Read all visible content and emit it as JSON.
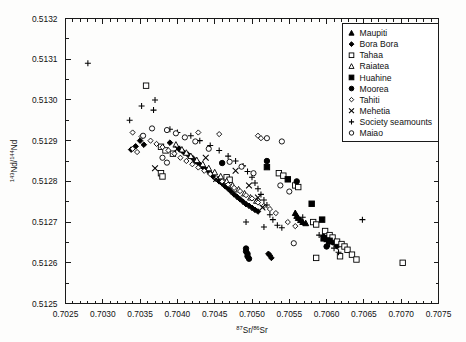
{
  "figure": {
    "background": "#fdfdfc",
    "axis_color": "#1a1a1a",
    "marker_color": "#000000"
  },
  "chart_data": {
    "type": "scatter",
    "title": "",
    "xlabel": "87Sr/86Sr",
    "xlabel_parts": {
      "sup1": "87",
      "base1": "Sr/",
      "sup2": "86",
      "base2": "Sr"
    },
    "ylabel": "143Nd/144Nd",
    "ylabel_parts": {
      "sup1": "143",
      "base1": "Nd/",
      "sup2": "144",
      "base2": "Nd"
    },
    "xlim": [
      0.7025,
      0.7075
    ],
    "ylim": [
      0.5125,
      0.5132
    ],
    "xticks": [
      0.7025,
      0.703,
      0.7035,
      0.704,
      0.7045,
      0.705,
      0.7055,
      0.706,
      0.7065,
      0.707,
      0.7075
    ],
    "xticklabels": [
      "0.7025",
      "0.7030",
      "0.7035",
      "0.7040",
      "0.7045",
      "0.7050",
      "0.7055",
      "0.7060",
      "0.7065",
      "0.7070",
      "0.7075"
    ],
    "yticks": [
      0.5125,
      0.5126,
      0.5127,
      0.5128,
      0.5129,
      0.513,
      0.5131,
      0.5132
    ],
    "yticklabels": [
      "0.5125",
      "0.5126",
      "0.5127",
      "0.5128",
      "0.5129",
      "0.5130",
      "0.5131",
      "0.5132"
    ],
    "x_minor_interval": 0.0001,
    "y_minor_interval": 5e-05,
    "grid": false,
    "legend_position": "top-right",
    "series": [
      {
        "name": "Maupiti",
        "marker": "filled-triangle",
        "points": [
          [
            0.70562,
            0.51271
          ],
          [
            0.70565,
            0.512705
          ],
          [
            0.70568,
            0.5127
          ],
          [
            0.70572,
            0.512697
          ],
          [
            0.7056,
            0.512715
          ],
          [
            0.70558,
            0.512722
          ]
        ]
      },
      {
        "name": "Bora Bora",
        "marker": "filled-diamond",
        "points": [
          [
            0.7039,
            0.512895
          ],
          [
            0.70402,
            0.51288
          ],
          [
            0.70408,
            0.512872
          ],
          [
            0.70414,
            0.512866
          ],
          [
            0.7042,
            0.512858
          ],
          [
            0.70424,
            0.51285
          ],
          [
            0.70428,
            0.512845
          ],
          [
            0.70432,
            0.512838
          ],
          [
            0.70436,
            0.512832
          ],
          [
            0.7044,
            0.512828
          ],
          [
            0.70444,
            0.51282
          ],
          [
            0.70448,
            0.512812
          ],
          [
            0.70452,
            0.512806
          ],
          [
            0.70456,
            0.5128
          ],
          [
            0.7046,
            0.512795
          ],
          [
            0.70464,
            0.512788
          ],
          [
            0.70468,
            0.512782
          ],
          [
            0.70472,
            0.512775
          ],
          [
            0.70476,
            0.512768
          ],
          [
            0.7048,
            0.512762
          ],
          [
            0.70484,
            0.512756
          ],
          [
            0.70488,
            0.51275
          ],
          [
            0.70492,
            0.512744
          ],
          [
            0.70496,
            0.51274
          ],
          [
            0.705,
            0.512735
          ],
          [
            0.70504,
            0.51273
          ],
          [
            0.70508,
            0.512726
          ],
          [
            0.70596,
            0.512665
          ],
          [
            0.706,
            0.51266
          ],
          [
            0.70604,
            0.512655
          ],
          [
            0.70608,
            0.51265
          ],
          [
            0.70612,
            0.512646
          ],
          [
            0.70614,
            0.51264
          ],
          [
            0.7035,
            0.5129
          ],
          [
            0.70355,
            0.51289
          ],
          [
            0.70344,
            0.512886
          ],
          [
            0.70338,
            0.512878
          ],
          [
            0.70522,
            0.512622
          ],
          [
            0.70524,
            0.512618
          ],
          [
            0.70526,
            0.512612
          ]
        ]
      },
      {
        "name": "Tahaa",
        "marker": "open-square",
        "points": [
          [
            0.70358,
            0.513035
          ],
          [
            0.70378,
            0.512885
          ],
          [
            0.70384,
            0.512876
          ],
          [
            0.70394,
            0.512868
          ],
          [
            0.70466,
            0.51281
          ],
          [
            0.7047,
            0.512804
          ],
          [
            0.70536,
            0.51282
          ],
          [
            0.70542,
            0.512814
          ],
          [
            0.70558,
            0.51279
          ],
          [
            0.70562,
            0.512786
          ],
          [
            0.70582,
            0.5127
          ],
          [
            0.70586,
            0.512694
          ],
          [
            0.70598,
            0.512678
          ],
          [
            0.70604,
            0.512668
          ],
          [
            0.70608,
            0.512662
          ],
          [
            0.70614,
            0.512652
          ],
          [
            0.7062,
            0.512646
          ],
          [
            0.70624,
            0.51264
          ],
          [
            0.70628,
            0.512632
          ],
          [
            0.70634,
            0.51262
          ],
          [
            0.7064,
            0.512608
          ],
          [
            0.70702,
            0.5126
          ],
          [
            0.70378,
            0.51282
          ],
          [
            0.7038,
            0.512812
          ],
          [
            0.70618,
            0.512616
          ],
          [
            0.70586,
            0.512612
          ]
        ]
      },
      {
        "name": "Raiatea",
        "marker": "open-triangle",
        "points": [
          [
            0.70398,
            0.51289
          ],
          [
            0.70406,
            0.512878
          ],
          [
            0.70412,
            0.51287
          ],
          [
            0.70418,
            0.512862
          ],
          [
            0.70426,
            0.512852
          ],
          [
            0.70434,
            0.512842
          ],
          [
            0.70442,
            0.512832
          ],
          [
            0.7045,
            0.512822
          ],
          [
            0.70458,
            0.512812
          ],
          [
            0.70466,
            0.5128
          ],
          [
            0.70474,
            0.51279
          ],
          [
            0.70482,
            0.51278
          ],
          [
            0.7049,
            0.51277
          ],
          [
            0.70498,
            0.51276
          ],
          [
            0.70506,
            0.512752
          ]
        ]
      },
      {
        "name": "Huahine",
        "marker": "filled-square",
        "points": [
          [
            0.70548,
            0.512805
          ],
          [
            0.7058,
            0.512745
          ],
          [
            0.70594,
            0.512706
          ],
          [
            0.70596,
            0.51266
          ],
          [
            0.70604,
            0.512654
          ],
          [
            0.7052,
            0.512835
          ]
        ]
      },
      {
        "name": "Moorea",
        "marker": "filled-circle",
        "points": [
          [
            0.70492,
            0.512635
          ],
          [
            0.70492,
            0.512628
          ],
          [
            0.70494,
            0.512622
          ],
          [
            0.70494,
            0.512616
          ],
          [
            0.70496,
            0.51261
          ],
          [
            0.7056,
            0.5128
          ],
          [
            0.7052,
            0.51285
          ],
          [
            0.706,
            0.51264
          ],
          [
            0.7046,
            0.512845
          ]
        ]
      },
      {
        "name": "Tahiti",
        "marker": "open-small-diamond",
        "points": [
          [
            0.7034,
            0.51292
          ],
          [
            0.70352,
            0.51291
          ],
          [
            0.70364,
            0.5129
          ],
          [
            0.70372,
            0.512892
          ],
          [
            0.7038,
            0.512884
          ],
          [
            0.70388,
            0.512876
          ],
          [
            0.70396,
            0.512868
          ],
          [
            0.70404,
            0.512858
          ],
          [
            0.70412,
            0.51285
          ],
          [
            0.7042,
            0.512842
          ],
          [
            0.70428,
            0.512834
          ],
          [
            0.70436,
            0.512826
          ],
          [
            0.70444,
            0.512818
          ],
          [
            0.70452,
            0.512808
          ],
          [
            0.7046,
            0.5128
          ],
          [
            0.70468,
            0.512792
          ],
          [
            0.70476,
            0.512784
          ],
          [
            0.70484,
            0.512776
          ],
          [
            0.70492,
            0.512766
          ],
          [
            0.705,
            0.512758
          ],
          [
            0.70508,
            0.512748
          ],
          [
            0.70516,
            0.51274
          ],
          [
            0.70524,
            0.512732
          ],
          [
            0.70532,
            0.512722
          ],
          [
            0.70548,
            0.5127
          ],
          [
            0.70558,
            0.51269
          ],
          [
            0.70428,
            0.51292
          ],
          [
            0.70456,
            0.512916
          ],
          [
            0.70508,
            0.512912
          ],
          [
            0.70512,
            0.512906
          ],
          [
            0.7034,
            0.51288
          ],
          [
            0.70346,
            0.512872
          ]
        ]
      },
      {
        "name": "Mehetia",
        "marker": "x-cross",
        "points": [
          [
            0.704,
            0.51288
          ],
          [
            0.70438,
            0.512858
          ],
          [
            0.70478,
            0.512826
          ],
          [
            0.70496,
            0.51279
          ],
          [
            0.70508,
            0.51276
          ],
          [
            0.70514,
            0.512736
          ],
          [
            0.7037,
            0.512832
          ],
          [
            0.70452,
            0.512806
          ]
        ]
      },
      {
        "name": "Society seamounts",
        "marker": "plus-cross",
        "points": [
          [
            0.7028,
            0.51309
          ],
          [
            0.70352,
            0.512985
          ],
          [
            0.70368,
            0.512975
          ],
          [
            0.7037,
            0.513
          ],
          [
            0.7039,
            0.512928
          ],
          [
            0.704,
            0.51292
          ],
          [
            0.70418,
            0.512912
          ],
          [
            0.7043,
            0.5129
          ],
          [
            0.70444,
            0.512888
          ],
          [
            0.70456,
            0.512876
          ],
          [
            0.70468,
            0.512862
          ],
          [
            0.70478,
            0.51285
          ],
          [
            0.70488,
            0.512838
          ],
          [
            0.70494,
            0.512824
          ],
          [
            0.705,
            0.51281
          ],
          [
            0.70504,
            0.512796
          ],
          [
            0.70508,
            0.512782
          ],
          [
            0.70512,
            0.512768
          ],
          [
            0.70516,
            0.512754
          ],
          [
            0.7052,
            0.512742
          ],
          [
            0.70524,
            0.512718
          ],
          [
            0.70528,
            0.512706
          ],
          [
            0.70534,
            0.512692
          ],
          [
            0.7054,
            0.512686
          ],
          [
            0.70568,
            0.512712
          ],
          [
            0.7059,
            0.512668
          ],
          [
            0.70596,
            0.512664
          ],
          [
            0.706,
            0.512652
          ],
          [
            0.70604,
            0.512646
          ],
          [
            0.7061,
            0.512636
          ],
          [
            0.70616,
            0.512626
          ],
          [
            0.70648,
            0.512706
          ],
          [
            0.70336,
            0.51295
          ],
          [
            0.70492,
            0.5127
          ],
          [
            0.70516,
            0.512688
          ]
        ]
      },
      {
        "name": "Maiao",
        "marker": "open-circle",
        "points": [
          [
            0.70366,
            0.51293
          ],
          [
            0.70386,
            0.512926
          ],
          [
            0.70398,
            0.512918
          ],
          [
            0.7041,
            0.512908
          ],
          [
            0.70424,
            0.512898
          ],
          [
            0.70442,
            0.51288
          ],
          [
            0.7047,
            0.512848
          ],
          [
            0.70486,
            0.512836
          ],
          [
            0.70502,
            0.51282
          ],
          [
            0.7054,
            0.512898
          ],
          [
            0.70538,
            0.51279
          ],
          [
            0.7055,
            0.512775
          ],
          [
            0.70556,
            0.512648
          ],
          [
            0.7038,
            0.512858
          ],
          [
            0.70386,
            0.512846
          ],
          [
            0.70354,
            0.512912
          ],
          [
            0.7052,
            0.512906
          ]
        ]
      }
    ]
  },
  "legend": {
    "entries": [
      {
        "label": "Maupiti",
        "marker": "filled-triangle"
      },
      {
        "label": "Bora Bora",
        "marker": "filled-diamond"
      },
      {
        "label": "Tahaa",
        "marker": "open-square"
      },
      {
        "label": "Raiatea",
        "marker": "open-triangle"
      },
      {
        "label": "Huahine",
        "marker": "filled-square"
      },
      {
        "label": "Moorea",
        "marker": "filled-circle"
      },
      {
        "label": "Tahiti",
        "marker": "open-small-diamond"
      },
      {
        "label": "Mehetia",
        "marker": "x-cross"
      },
      {
        "label": "Society seamounts",
        "marker": "plus-cross"
      },
      {
        "label": "Maiao",
        "marker": "open-circle"
      }
    ]
  }
}
